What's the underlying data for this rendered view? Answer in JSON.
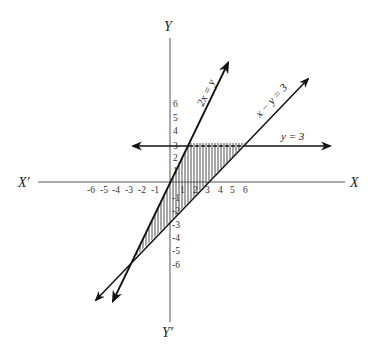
{
  "diagram": {
    "title": "",
    "axes": {
      "x_label": "X",
      "x_neg_label": "X′",
      "y_label": "Y",
      "y_neg_label": "Y′",
      "x_ticks_pos": [
        "1",
        "2",
        "3",
        "4",
        "5",
        "6"
      ],
      "x_ticks_neg": [
        "-1",
        "-2",
        "-3",
        "-4",
        "-5",
        "-6"
      ],
      "y_ticks_pos": [
        "1",
        "2",
        "3",
        "4",
        "5",
        "6"
      ],
      "y_ticks_neg": [
        "-1",
        "-2",
        "-3",
        "-4",
        "-5",
        "-6"
      ]
    },
    "lines": [
      {
        "label": "2x = y",
        "equation": "y = 2x"
      },
      {
        "label": "x − y = 3",
        "equation": "y = x - 3"
      },
      {
        "label": "y = 3",
        "equation": "y = 3"
      }
    ],
    "shaded_region": {
      "description": "Region bounded by 2x = y, x − y = 3 and y = 3 (vertices (1.5,3), (6,3), (-3,-6))",
      "vertices": [
        [
          1.5,
          3
        ],
        [
          6,
          3
        ],
        [
          -3,
          -6
        ]
      ],
      "pattern": "vertical hatching"
    },
    "colors": {
      "line": "#111111",
      "axis": "#555555",
      "background": "#ffffff"
    }
  }
}
